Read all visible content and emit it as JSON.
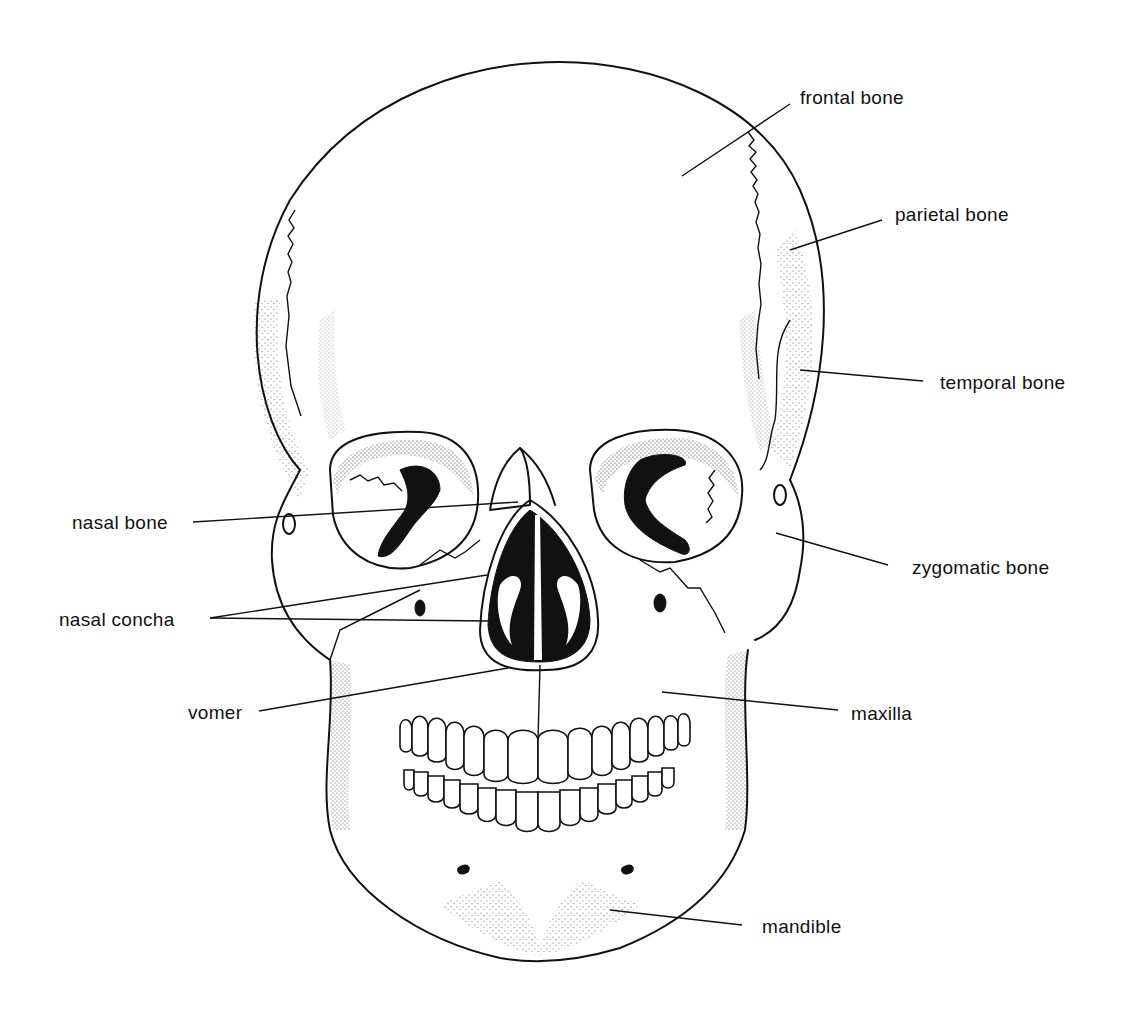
{
  "figure": {
    "background": "#ffffff",
    "ink_color": "#111111"
  },
  "labels": [
    {
      "id": "frontal",
      "text": "frontal bone",
      "x": 800,
      "y": 88,
      "line": [
        [
          790,
          104
        ],
        [
          682,
          176
        ]
      ]
    },
    {
      "id": "parietal",
      "text": "parietal bone",
      "x": 895,
      "y": 205,
      "line": [
        [
          882,
          220
        ],
        [
          790,
          250
        ]
      ]
    },
    {
      "id": "temporal",
      "text": "temporal bone",
      "x": 940,
      "y": 373,
      "line": [
        [
          923,
          381
        ],
        [
          800,
          370
        ]
      ]
    },
    {
      "id": "nasal_bone",
      "text": "nasal bone",
      "x": 72,
      "y": 513,
      "line": [
        [
          193,
          522
        ],
        [
          518,
          502
        ]
      ]
    },
    {
      "id": "zygomatic",
      "text": "zygomatic bone",
      "x": 901,
      "y": 558,
      "line": [
        [
          888,
          565
        ],
        [
          776,
          533
        ]
      ]
    },
    {
      "id": "nasal_concha",
      "text": "nasal concha",
      "x": 59,
      "y": 611,
      "line": [
        [
          210,
          618
        ],
        [
          487,
          575
        ]
      ],
      "line2": [
        [
          210,
          618
        ],
        [
          489,
          621
        ]
      ]
    },
    {
      "id": "maxilla",
      "text": "maxilla",
      "x": 851,
      "y": 704,
      "line": [
        [
          838,
          710
        ],
        [
          662,
          692
        ]
      ]
    },
    {
      "id": "vomer",
      "text": "vomer",
      "x": 188,
      "y": 703,
      "line": [
        [
          259,
          711
        ],
        [
          508,
          668
        ]
      ]
    },
    {
      "id": "mandible",
      "text": "mandible",
      "x": 762,
      "y": 917,
      "line": [
        [
          742,
          925
        ],
        [
          610,
          910
        ]
      ]
    }
  ]
}
